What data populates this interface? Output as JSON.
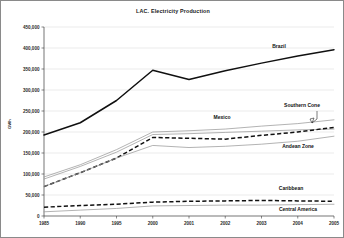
{
  "chart_data": {
    "type": "line",
    "title": "LAC. Electricity Production",
    "xlabel": "",
    "ylabel": "GWh",
    "x": [
      1985,
      1990,
      1995,
      2000,
      2001,
      2002,
      2003,
      2004,
      2005
    ],
    "tick_labels": [
      "1985",
      "1990",
      "1995",
      "2000",
      "2001",
      "2002",
      "2003",
      "2004",
      "2005"
    ],
    "ytick_labels": [
      "450,000",
      "400,000",
      "350,000",
      "300,000",
      "250,000",
      "200,000",
      "150,000",
      "100,000",
      "50,000",
      "0"
    ],
    "ytick_values": [
      450000,
      400000,
      350000,
      300000,
      250000,
      200000,
      150000,
      100000,
      50000,
      0
    ],
    "ylim": [
      0,
      450000
    ],
    "xlim": [
      1985,
      2005
    ],
    "grid": true,
    "legend_position": "inline-annotations",
    "series": [
      {
        "name": "Brazil",
        "style": "solid-thick-black",
        "values": [
          193000,
          222000,
          275000,
          347000,
          325000,
          346000,
          364000,
          381000,
          396000
        ]
      },
      {
        "name": "Southern Cone",
        "style": "thin-gray",
        "values": [
          93000,
          122000,
          158000,
          200000,
          203000,
          207000,
          214000,
          220000,
          229000
        ]
      },
      {
        "name": "Mexico",
        "style": "thin-gray",
        "values": [
          88000,
          118000,
          152000,
          194000,
          196000,
          199000,
          202000,
          205000,
          207000
        ]
      },
      {
        "name": "Andean Zone",
        "style": "dashed-black",
        "values": [
          70000,
          103000,
          138000,
          187000,
          185000,
          183000,
          192000,
          200000,
          211000
        ]
      },
      {
        "name": "Caribbean",
        "style": "thin-gray",
        "values": [
          70000,
          103000,
          138000,
          168000,
          163000,
          166000,
          171000,
          178000,
          190000
        ]
      },
      {
        "name": "Caribbean-dash",
        "style": "dashed-black",
        "values": [
          21000,
          25000,
          28000,
          33000,
          35000,
          36000,
          37000,
          36000,
          35000
        ]
      },
      {
        "name": "Central America",
        "style": "thin-gray",
        "values": [
          10000,
          14000,
          18000,
          24000,
          25000,
          26000,
          26000,
          27000,
          28000
        ]
      }
    ],
    "annotations": [
      {
        "text": "Brazil",
        "x_px": 278,
        "y_px": 47
      },
      {
        "text": "Southern Cone",
        "x_px": 301,
        "y_px": 106
      },
      {
        "text": "Mexico",
        "x_px": 221,
        "y_px": 118
      },
      {
        "text": "Andean Zone",
        "x_px": 297,
        "y_px": 147
      },
      {
        "text": "Caribbean",
        "x_px": 290,
        "y_px": 189
      },
      {
        "text": "Central America",
        "x_px": 297,
        "y_px": 210
      }
    ]
  }
}
